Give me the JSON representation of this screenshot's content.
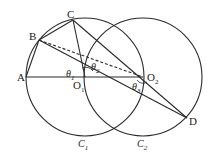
{
  "diagram": {
    "points": {
      "A": {
        "label": "A"
      },
      "B": {
        "label": "B"
      },
      "C": {
        "label": "C"
      },
      "D": {
        "label": "D"
      },
      "O1": {
        "label": "O",
        "sub": "1"
      },
      "O2": {
        "label": "O",
        "sub": "2"
      }
    },
    "angles": [
      {
        "label": "θ",
        "sub": "1"
      },
      {
        "label": "θ",
        "sub": "2"
      },
      {
        "label": "θ",
        "sub": "3"
      }
    ],
    "circles": [
      {
        "label": "C",
        "sub": "1"
      },
      {
        "label": "C",
        "sub": "2"
      }
    ],
    "colors": {
      "stroke": "#2a2a2a",
      "background": "#ffffff"
    }
  }
}
